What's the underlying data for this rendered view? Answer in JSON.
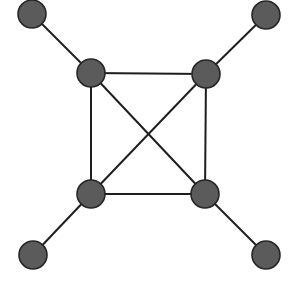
{
  "diagram": {
    "type": "graph",
    "style": {
      "node_fill": "#5b5b5b",
      "node_stroke": "#262626",
      "edge_color": "#1e1e1e",
      "background": "#ffffff",
      "node_radius": 14
    },
    "nodes": [
      {
        "id": "tl_outer",
        "x": 32,
        "y": 14
      },
      {
        "id": "tr_outer",
        "x": 266,
        "y": 15
      },
      {
        "id": "tl_inner",
        "x": 91,
        "y": 73
      },
      {
        "id": "tr_inner",
        "x": 206,
        "y": 74
      },
      {
        "id": "bl_inner",
        "x": 91,
        "y": 194
      },
      {
        "id": "br_inner",
        "x": 205,
        "y": 194
      },
      {
        "id": "bl_outer",
        "x": 33,
        "y": 255
      },
      {
        "id": "br_outer",
        "x": 266,
        "y": 255
      }
    ],
    "edges": [
      [
        "tl_outer",
        "tl_inner"
      ],
      [
        "tr_outer",
        "tr_inner"
      ],
      [
        "bl_outer",
        "bl_inner"
      ],
      [
        "br_outer",
        "br_inner"
      ],
      [
        "tl_inner",
        "tr_inner"
      ],
      [
        "tr_inner",
        "br_inner"
      ],
      [
        "br_inner",
        "bl_inner"
      ],
      [
        "bl_inner",
        "tl_inner"
      ],
      [
        "tl_inner",
        "br_inner"
      ],
      [
        "tr_inner",
        "bl_inner"
      ]
    ]
  }
}
